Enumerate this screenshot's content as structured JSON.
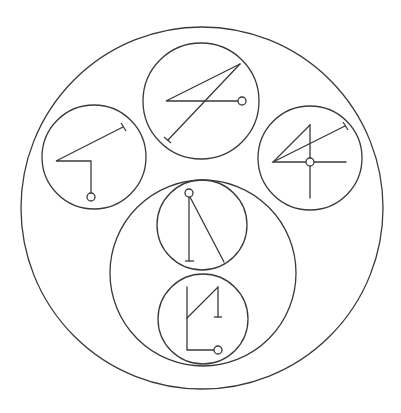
{
  "diagram": {
    "width": 401,
    "height": 413,
    "background": "#ffffff",
    "stroke": "#3a3a3a",
    "stroke_width": 1.3,
    "circles": [
      {
        "id": "outer-circle",
        "cx": 202,
        "cy": 208,
        "r": 181
      },
      {
        "id": "top-circle",
        "cx": 201,
        "cy": 101,
        "r": 58
      },
      {
        "id": "left-circle",
        "cx": 94,
        "cy": 157,
        "r": 52
      },
      {
        "id": "right-circle",
        "cx": 310,
        "cy": 158,
        "r": 52
      },
      {
        "id": "lower-group-circle",
        "cx": 203,
        "cy": 273,
        "r": 93
      },
      {
        "id": "upper-inner-circle",
        "cx": 202,
        "cy": 225,
        "r": 45
      },
      {
        "id": "lower-inner-circle",
        "cx": 203,
        "cy": 319,
        "r": 45
      }
    ],
    "glyphs": [
      {
        "id": "top-glyph",
        "paths": [
          "M240,64 L166,101 L238,101",
          "M240,64 L168,140"
        ],
        "tbars": [
          [
            164,
            137,
            171,
            143
          ]
        ],
        "nodes": [
          [
            242,
            101
          ]
        ]
      },
      {
        "id": "left-glyph",
        "paths": [
          "M123,127 L56,161 L91,161 L91,193"
        ],
        "tbars": [
          [
            121,
            123,
            126,
            131
          ]
        ],
        "nodes": [
          [
            91,
            197
          ]
        ]
      },
      {
        "id": "right-glyph",
        "paths": [
          "M310,125 L273,162 L306,162",
          "M314,162 L346,162",
          "M310,125 L310,158",
          "M310,166 L310,198",
          "M273,162 L345,126"
        ],
        "tbars": [
          [
            343,
            122,
            348,
            130
          ]
        ],
        "nodes": [
          [
            310,
            162
          ]
        ]
      },
      {
        "id": "upper-inner-glyph",
        "paths": [
          "M189,197 L189,261",
          "M190,197 L224,262"
        ],
        "tbars": [
          [
            185,
            261,
            194,
            261
          ]
        ],
        "nodes": [
          [
            189,
            193
          ]
        ]
      },
      {
        "id": "lower-inner-glyph",
        "paths": [
          "M187,287 L187,350 L214,350",
          "M187,318 L218,287 L218,317"
        ],
        "tbars": [
          [
            214,
            317,
            222,
            317
          ]
        ],
        "nodes": [
          [
            218,
            350
          ]
        ]
      }
    ],
    "node_radius": 4
  }
}
